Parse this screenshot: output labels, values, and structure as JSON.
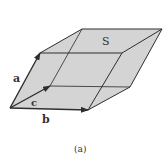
{
  "figure": {
    "caption": "(a)",
    "face_label": "S",
    "vectors": [
      {
        "name": "a",
        "label": "a"
      },
      {
        "name": "b",
        "label": "b"
      },
      {
        "name": "c",
        "label": "c"
      }
    ]
  },
  "colors": {
    "face_fill": "#d4d4d4",
    "edge": "#2e2e2e",
    "text": "#333333"
  }
}
